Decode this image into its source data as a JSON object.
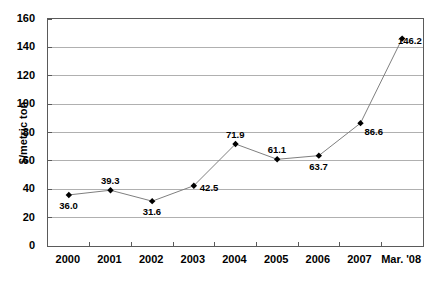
{
  "chart_data": {
    "type": "line",
    "title": "",
    "xlabel": "",
    "ylabel": "$/metric ton",
    "categories": [
      "2000",
      "2001",
      "2002",
      "2003",
      "2004",
      "2005",
      "2006",
      "2007",
      "Mar. '08"
    ],
    "values": [
      36.0,
      39.3,
      31.6,
      42.5,
      71.9,
      61.1,
      63.7,
      86.6,
      146.2
    ],
    "point_labels": [
      "36.0",
      "39.3",
      "31.6",
      "42.5",
      "71.9",
      "61.1",
      "63.7",
      "86.6",
      "146.2"
    ],
    "label_positions": [
      "below",
      "above",
      "below",
      "right",
      "above",
      "above",
      "below",
      "below-right",
      "right"
    ],
    "ylim": [
      0,
      160
    ],
    "ytick_step": 20,
    "ytick_labels": [
      "0",
      "20",
      "40",
      "60",
      "80",
      "100",
      "120",
      "140",
      "160"
    ],
    "ytick_values": [
      0,
      20,
      40,
      60,
      80,
      100,
      120,
      140,
      160
    ],
    "grid": "horizontal",
    "legend": "none",
    "marker": "diamond",
    "marker_color": "#000000",
    "line_color": "#7f7f7f",
    "grid_color": "#b0b0b0",
    "axis_color": "#5a5a5a",
    "background": "#ffffff"
  }
}
